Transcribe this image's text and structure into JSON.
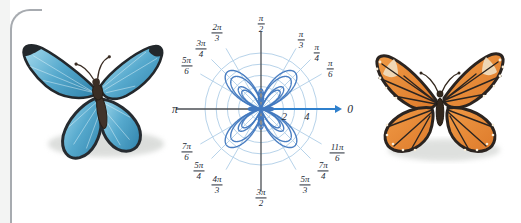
{
  "figure": {
    "left_butterfly_alt": "blue morpho butterfly illustration",
    "right_butterfly_alt": "orange monarch butterfly illustration"
  },
  "chart_data": {
    "type": "line",
    "subtype": "polar",
    "curve_name": "butterfly curve",
    "layout": {
      "cx": 93,
      "cy": 109,
      "px_per_unit": 11.2,
      "spoke_len": 70,
      "axis_left": 85,
      "axis_up": 77,
      "axis_down": 82,
      "arrow_len": 81,
      "grid_on": true
    },
    "grid": {
      "circle_radii": [
        1,
        2,
        3,
        4,
        5
      ],
      "spoke_angles_deg": [
        30,
        45,
        60,
        120,
        135,
        150,
        210,
        225,
        240,
        300,
        315,
        330
      ]
    },
    "radial_ticks": [
      {
        "label": "2",
        "value": 2
      },
      {
        "label": "4",
        "value": 4
      }
    ],
    "angle_labels": [
      {
        "deg": 0,
        "plain": "0",
        "r": 89
      },
      {
        "deg": 30,
        "num": "π",
        "den": "6",
        "r": 80
      },
      {
        "deg": 45,
        "num": "π",
        "den": "4",
        "r": 79
      },
      {
        "deg": 60,
        "num": "π",
        "den": "3",
        "r": 80
      },
      {
        "deg": 90,
        "num": "π",
        "den": "2",
        "r": 85
      },
      {
        "deg": 120,
        "num": "2π",
        "den": "3",
        "r": 88
      },
      {
        "deg": 135,
        "num": "3π",
        "den": "4",
        "r": 85
      },
      {
        "deg": 150,
        "num": "5π",
        "den": "6",
        "r": 86
      },
      {
        "deg": 180,
        "plain": "π",
        "r": 86
      },
      {
        "deg": 210,
        "num": "7π",
        "den": "6",
        "r": 86
      },
      {
        "deg": 225,
        "num": "5π",
        "den": "4",
        "r": 88
      },
      {
        "deg": 240,
        "num": "4π",
        "den": "3",
        "r": 88
      },
      {
        "deg": 270,
        "num": "3π",
        "den": "2",
        "r": 89
      },
      {
        "deg": 300,
        "num": "5π",
        "den": "3",
        "r": 88
      },
      {
        "deg": 315,
        "num": "7π",
        "den": "4",
        "r": 88
      },
      {
        "deg": 330,
        "num": "11π",
        "den": "6",
        "r": 88
      }
    ],
    "curves": [
      {
        "expr": "1.1*(Math.exp(Math.sin(t))-2*Math.cos(4*t))"
      },
      {
        "expr": "1.1*(Math.exp(-Math.sin(t))-2*Math.cos(4*t))"
      },
      {
        "expr": "0.93*(Math.exp(Math.sin(t))-2*Math.cos(4*t))"
      },
      {
        "expr": "0.93*(Math.exp(-Math.sin(t))-2*Math.cos(4*t))"
      }
    ],
    "theta_range": [
      0,
      6.28318
    ],
    "colors": {
      "grid": "#b7d3ea",
      "axis": "#4b4f54",
      "arrow": "#2f80cd",
      "curve": "#4178bf",
      "label": "#232a36"
    }
  }
}
